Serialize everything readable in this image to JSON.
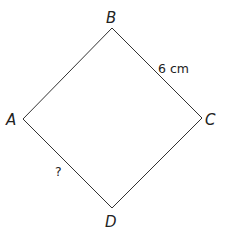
{
  "figure": {
    "shape": "square",
    "vertices": [
      {
        "name": "A",
        "x": 23,
        "y": 119
      },
      {
        "name": "B",
        "x": 112,
        "y": 28
      },
      {
        "name": "C",
        "x": 202,
        "y": 118
      },
      {
        "name": "D",
        "x": 112,
        "y": 208
      }
    ],
    "labels": {
      "A": "A",
      "B": "B",
      "C": "C",
      "D": "D"
    },
    "edges": [
      {
        "from": "A",
        "to": "B",
        "label": ""
      },
      {
        "from": "B",
        "to": "C",
        "label": "6 cm"
      },
      {
        "from": "C",
        "to": "D",
        "label": ""
      },
      {
        "from": "D",
        "to": "A",
        "label": "?"
      }
    ],
    "edge_labels": {
      "bc": "6 cm",
      "ad": "?"
    },
    "colors": {
      "line": "#333333",
      "text": "#222222",
      "background": "#ffffff"
    }
  }
}
